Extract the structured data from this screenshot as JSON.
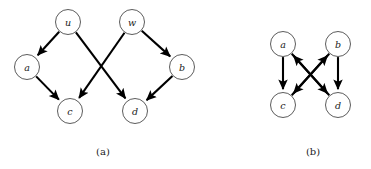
{
  "figure": {
    "background_color": "#ffffff",
    "edge_color": "#000000",
    "node_fill_color": "#ffffff",
    "node_stroke_color": "#4a4a4a",
    "label_color": "#1a1a1a",
    "panels": [
      {
        "id": "panel-a",
        "caption": "(a)",
        "caption_x": 103,
        "caption_y": 151,
        "node_radius": 12.5,
        "nodes": [
          {
            "id": "u",
            "label": "u",
            "cx": 68,
            "cy": 22
          },
          {
            "id": "w",
            "label": "w",
            "cx": 132,
            "cy": 22
          },
          {
            "id": "a",
            "label": "a",
            "cx": 27,
            "cy": 67
          },
          {
            "id": "b",
            "label": "b",
            "cx": 182,
            "cy": 67
          },
          {
            "id": "c",
            "label": "c",
            "cx": 70,
            "cy": 111
          },
          {
            "id": "d",
            "label": "d",
            "cx": 135,
            "cy": 111
          }
        ],
        "edges": [
          {
            "from": "u",
            "to": "a",
            "directed": true
          },
          {
            "from": "u",
            "to": "d",
            "directed": true
          },
          {
            "from": "w",
            "to": "c",
            "directed": true
          },
          {
            "from": "w",
            "to": "b",
            "directed": true
          },
          {
            "from": "a",
            "to": "c",
            "directed": true
          },
          {
            "from": "b",
            "to": "d",
            "directed": true
          }
        ]
      },
      {
        "id": "panel-b",
        "caption": "(b)",
        "caption_x": 313,
        "caption_y": 151,
        "node_radius": 12.5,
        "nodes": [
          {
            "id": "a",
            "label": "a",
            "cx": 283,
            "cy": 44
          },
          {
            "id": "b",
            "label": "b",
            "cx": 338,
            "cy": 44
          },
          {
            "id": "c",
            "label": "c",
            "cx": 283,
            "cy": 105
          },
          {
            "id": "d",
            "label": "d",
            "cx": 338,
            "cy": 105
          }
        ],
        "edges": [
          {
            "from": "a",
            "to": "c",
            "directed": true
          },
          {
            "from": "a",
            "to": "d",
            "directed": true
          },
          {
            "from": "b",
            "to": "c",
            "directed": true
          },
          {
            "from": "b",
            "to": "d",
            "directed": true
          },
          {
            "from": "d",
            "to": "a",
            "directed": true
          },
          {
            "from": "c",
            "to": "b",
            "directed": true
          }
        ]
      }
    ]
  }
}
